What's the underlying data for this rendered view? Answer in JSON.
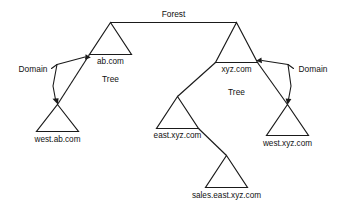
{
  "diagram": {
    "type": "active-directory-forest-tree-diagram",
    "title": "Forest",
    "colors": {
      "background": "#ffffff",
      "stroke": "#1a1a1a",
      "text": "#111111"
    },
    "labels": {
      "forest": "Forest",
      "domain_left": "Domain",
      "domain_right": "Domain",
      "tree_left": "Tree",
      "tree_right": "Tree"
    },
    "nodes": [
      {
        "id": "ab",
        "label": "ab.com"
      },
      {
        "id": "west-ab",
        "label": "west.ab.com"
      },
      {
        "id": "xyz",
        "label": "xyz.com"
      },
      {
        "id": "east-xyz",
        "label": "east.xyz.com"
      },
      {
        "id": "west-xyz",
        "label": "west.xyz.com"
      },
      {
        "id": "sales-east-xyz",
        "label": "sales.east.xyz.com"
      }
    ],
    "annotations": [
      {
        "id": "domain-left",
        "label": "Domain",
        "points_to": [
          "ab.com",
          "west.ab.com"
        ]
      },
      {
        "id": "domain-right",
        "label": "Domain",
        "points_to": [
          "xyz.com",
          "west.xyz.com"
        ]
      },
      {
        "id": "tree-left",
        "label": "Tree",
        "describes": "ab.com tree"
      },
      {
        "id": "tree-right",
        "label": "Tree",
        "describes": "xyz.com tree"
      },
      {
        "id": "forest",
        "label": "Forest",
        "describes": "both trees joined at top"
      }
    ]
  }
}
